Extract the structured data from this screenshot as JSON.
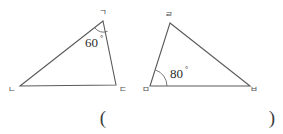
{
  "figure": {
    "background_color": "#ffffff",
    "stroke_color": "#5a5a5a",
    "text_color": "#2b2b2b",
    "left_triangle": {
      "name": "triangle-left",
      "vertices": [
        {
          "label": "ㄱ",
          "role": "apex",
          "x": 103,
          "y": 21
        },
        {
          "label": "ㄴ",
          "role": "bottom-left",
          "x": 20,
          "y": 86
        },
        {
          "label": "ㄷ",
          "role": "bottom-right",
          "x": 116,
          "y": 85
        }
      ],
      "angle": {
        "value": "60",
        "degree_symbol": "°",
        "at_vertex": "ㄱ"
      }
    },
    "right_triangle": {
      "name": "triangle-right",
      "vertices": [
        {
          "label": "ㄹ",
          "role": "apex",
          "x": 170,
          "y": 23
        },
        {
          "label": "ㅁ",
          "role": "bottom-left",
          "x": 150,
          "y": 86
        },
        {
          "label": "ㅂ",
          "role": "bottom-right",
          "x": 250,
          "y": 86
        }
      ],
      "angle": {
        "value": "80",
        "degree_symbol": "°",
        "at_vertex": "ㅁ"
      }
    },
    "answer_blank": {
      "open_paren": "(",
      "close_paren": ")"
    }
  }
}
